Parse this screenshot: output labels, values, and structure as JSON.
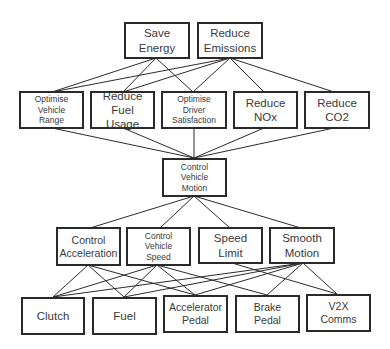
{
  "diagram": {
    "title": "",
    "levels": [
      {
        "level": 1,
        "nodes": [
          {
            "id": "save-energy",
            "label": "Save\nEnergy"
          },
          {
            "id": "reduce-emissions",
            "label": "Reduce\nEmissions"
          }
        ]
      },
      {
        "level": 2,
        "nodes": [
          {
            "id": "optimise-vehicle-range",
            "label": "Optimise\nVehicle\nRange"
          },
          {
            "id": "reduce-fuel-usage",
            "label": "Reduce\nFuel Usage"
          },
          {
            "id": "optimise-driver-satisfaction",
            "label": "Optimise\nDriver\nSatisfaction"
          },
          {
            "id": "reduce-nox",
            "label": "Reduce\nNOx"
          },
          {
            "id": "reduce-co2",
            "label": "Reduce\nCO2"
          }
        ]
      },
      {
        "level": 3,
        "nodes": [
          {
            "id": "control-vehicle-motion",
            "label": "Control\nVehicle\nMotion"
          }
        ]
      },
      {
        "level": 4,
        "nodes": [
          {
            "id": "control-acceleration",
            "label": "Control\nAcceleration"
          },
          {
            "id": "control-vehicle-speed",
            "label": "Control\nVehicle\nSpeed"
          },
          {
            "id": "speed-limit",
            "label": "Speed\nLimit"
          },
          {
            "id": "smooth-motion",
            "label": "Smooth\nMotion"
          }
        ]
      },
      {
        "level": 5,
        "nodes": [
          {
            "id": "clutch",
            "label": "Clutch"
          },
          {
            "id": "fuel",
            "label": "Fuel"
          },
          {
            "id": "accelerator-pedal",
            "label": "Accelerator\nPedal"
          },
          {
            "id": "brake-pedal",
            "label": "Brake\nPedal"
          },
          {
            "id": "v2x-comms",
            "label": "V2X\nComms"
          }
        ]
      }
    ],
    "edges": [
      [
        "save-energy",
        "optimise-vehicle-range"
      ],
      [
        "save-energy",
        "reduce-fuel-usage"
      ],
      [
        "save-energy",
        "optimise-driver-satisfaction"
      ],
      [
        "reduce-emissions",
        "optimise-vehicle-range"
      ],
      [
        "reduce-emissions",
        "reduce-fuel-usage"
      ],
      [
        "reduce-emissions",
        "optimise-driver-satisfaction"
      ],
      [
        "reduce-emissions",
        "reduce-nox"
      ],
      [
        "reduce-emissions",
        "reduce-co2"
      ],
      [
        "optimise-vehicle-range",
        "control-vehicle-motion"
      ],
      [
        "reduce-fuel-usage",
        "control-vehicle-motion"
      ],
      [
        "optimise-driver-satisfaction",
        "control-vehicle-motion"
      ],
      [
        "reduce-nox",
        "control-vehicle-motion"
      ],
      [
        "reduce-co2",
        "control-vehicle-motion"
      ],
      [
        "control-vehicle-motion",
        "control-acceleration"
      ],
      [
        "control-vehicle-motion",
        "control-vehicle-speed"
      ],
      [
        "control-vehicle-motion",
        "speed-limit"
      ],
      [
        "control-vehicle-motion",
        "smooth-motion"
      ],
      [
        "control-acceleration",
        "clutch"
      ],
      [
        "control-acceleration",
        "fuel"
      ],
      [
        "control-acceleration",
        "accelerator-pedal"
      ],
      [
        "control-vehicle-speed",
        "clutch"
      ],
      [
        "control-vehicle-speed",
        "fuel"
      ],
      [
        "control-vehicle-speed",
        "accelerator-pedal"
      ],
      [
        "control-vehicle-speed",
        "brake-pedal"
      ],
      [
        "speed-limit",
        "v2x-comms"
      ],
      [
        "smooth-motion",
        "clutch"
      ],
      [
        "smooth-motion",
        "fuel"
      ],
      [
        "smooth-motion",
        "accelerator-pedal"
      ],
      [
        "smooth-motion",
        "brake-pedal"
      ],
      [
        "smooth-motion",
        "v2x-comms"
      ]
    ],
    "colors": {
      "border": "#2a2a2a",
      "text": "#3a3a3a",
      "line": "#2b2b2b",
      "background": "#ffffff"
    }
  }
}
